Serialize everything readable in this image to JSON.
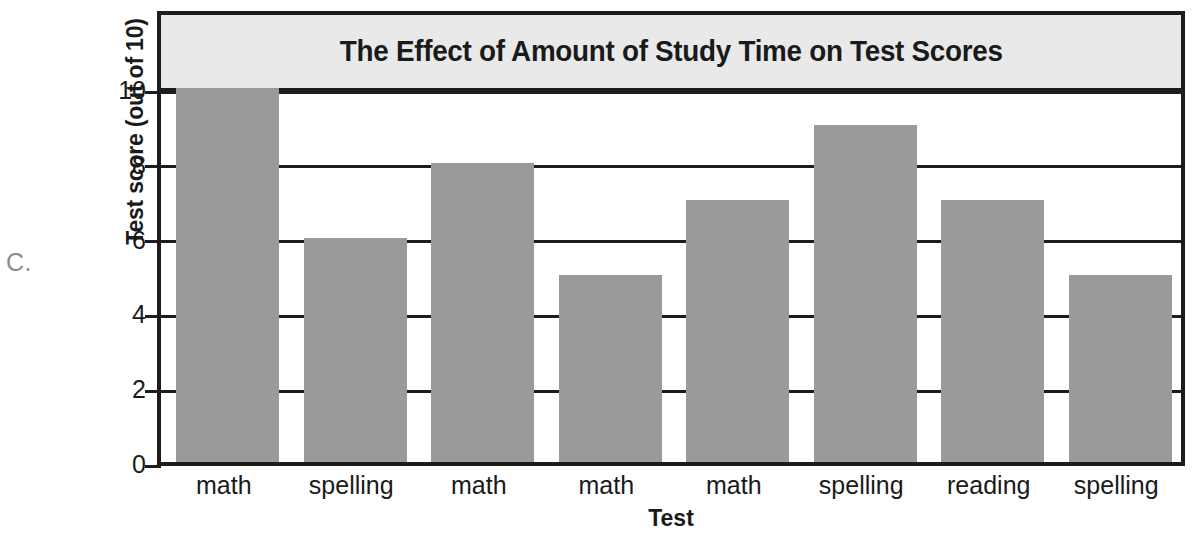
{
  "figure": {
    "label": "C."
  },
  "chart_data": {
    "type": "bar",
    "title": "The Effect of Amount of Study Time on Test Scores",
    "xlabel": "Test",
    "ylabel": "Test score (out of 10)",
    "categories": [
      "math",
      "spelling",
      "math",
      "math",
      "math",
      "spelling",
      "reading",
      "spelling"
    ],
    "values": [
      10,
      6,
      8,
      5,
      7,
      9,
      7,
      5
    ],
    "ylim": [
      0,
      10
    ],
    "ytick_values": [
      0,
      2,
      4,
      6,
      8,
      10
    ],
    "ytick_labels": [
      "0",
      "2",
      "4",
      "6",
      "8",
      "10"
    ],
    "grid": true,
    "legend": false,
    "bar_color": "#9a9a9a",
    "axis_color": "#1c1c1c",
    "title_band_color": "#e9e9e9",
    "background_color": "#ffffff"
  }
}
